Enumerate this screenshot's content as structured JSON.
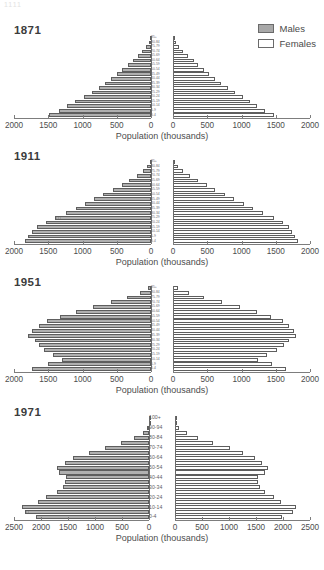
{
  "figure": {
    "top_fragment": "1111",
    "axis_label": "Population (thousands)",
    "legend": {
      "males_label": "Males",
      "females_label": "Females",
      "males_color": "#b0b0b0",
      "females_color": "#ffffff",
      "outline_color": "#5e5e5e"
    }
  },
  "chart_data": [
    {
      "type": "bar",
      "title": "1871",
      "subtype": "population-pyramid",
      "xlabel": "Population (thousands)",
      "ylabel": "",
      "xlim": [
        0,
        2000
      ],
      "ticks": [
        2000,
        1500,
        1000,
        500,
        0
      ],
      "ticks_right": [
        0,
        500,
        1000,
        1500,
        2000
      ],
      "grid": false,
      "legend_position": "top-right",
      "categories": [
        "0-4",
        "5-9",
        "10-14",
        "15-19",
        "20-24",
        "25-29",
        "30-34",
        "35-39",
        "40-44",
        "45-49",
        "50-54",
        "55-59",
        "60-64",
        "65-69",
        "70-74",
        "75-79",
        "80-84",
        "85+"
      ],
      "series": [
        {
          "name": "Males",
          "values": [
            1490,
            1350,
            1230,
            1105,
            985,
            860,
            760,
            665,
            580,
            500,
            425,
            340,
            270,
            195,
            130,
            75,
            36,
            14
          ]
        },
        {
          "name": "Females",
          "values": [
            1470,
            1345,
            1230,
            1125,
            1020,
            905,
            800,
            700,
            610,
            530,
            455,
            370,
            300,
            220,
            152,
            92,
            46,
            20
          ]
        }
      ]
    },
    {
      "type": "bar",
      "title": "1911",
      "subtype": "population-pyramid",
      "xlabel": "Population (thousands)",
      "ylabel": "",
      "xlim": [
        0,
        2000
      ],
      "ticks": [
        2000,
        1500,
        1000,
        500,
        0
      ],
      "ticks_right": [
        0,
        500,
        1000,
        1500,
        2000
      ],
      "grid": false,
      "legend_position": "none",
      "categories": [
        "0-4",
        "5-9",
        "10-14",
        "15-19",
        "20-24",
        "25-29",
        "30-34",
        "35-39",
        "40-44",
        "45-49",
        "50-54",
        "55-59",
        "60-64",
        "65-69",
        "70-74",
        "75-79",
        "80-84",
        "85+"
      ],
      "series": [
        {
          "name": "Males",
          "values": [
            1840,
            1790,
            1735,
            1660,
            1540,
            1395,
            1245,
            1100,
            960,
            830,
            700,
            560,
            430,
            315,
            210,
            120,
            55,
            18
          ]
        },
        {
          "name": "Females",
          "values": [
            1820,
            1780,
            1730,
            1690,
            1600,
            1470,
            1320,
            1175,
            1030,
            890,
            760,
            620,
            490,
            370,
            255,
            152,
            74,
            27
          ]
        }
      ]
    },
    {
      "type": "bar",
      "title": "1951",
      "subtype": "population-pyramid",
      "xlabel": "Population (thousands)",
      "ylabel": "",
      "xlim": [
        0,
        2000
      ],
      "ticks": [
        2000,
        1500,
        1000,
        500,
        0
      ],
      "ticks_right": [
        0,
        500,
        1000,
        1500,
        2000
      ],
      "grid": false,
      "legend_position": "none",
      "categories": [
        "0-4",
        "5-9",
        "10-14",
        "15-19",
        "20-24",
        "25-29",
        "30-34",
        "35-39",
        "40-44",
        "45-49",
        "50-54",
        "55-59",
        "60-64",
        "65-69",
        "70-74",
        "75-79",
        "80-84",
        "85+"
      ],
      "series": [
        {
          "name": "Males",
          "values": [
            1730,
            1510,
            1300,
            1430,
            1560,
            1640,
            1700,
            1790,
            1730,
            1640,
            1520,
            1330,
            1100,
            840,
            580,
            350,
            165,
            50
          ]
        },
        {
          "name": "Females",
          "values": [
            1650,
            1440,
            1245,
            1375,
            1520,
            1615,
            1690,
            1800,
            1760,
            1700,
            1600,
            1430,
            1230,
            975,
            710,
            455,
            235,
            80
          ]
        }
      ]
    },
    {
      "type": "bar",
      "title": "1971",
      "subtype": "population-pyramid",
      "xlabel": "Population (thousands)",
      "ylabel": "",
      "xlim": [
        0,
        2500
      ],
      "ticks": [
        2500,
        2000,
        1500,
        1000,
        500,
        0
      ],
      "ticks_right": [
        0,
        500,
        1000,
        1500,
        2000,
        2500
      ],
      "grid": false,
      "legend_position": "none",
      "categories": [
        "0-4",
        "5-9",
        "10-14",
        "15-19",
        "20-24",
        "25-29",
        "30-34",
        "35-39",
        "40-44",
        "45-49",
        "50-54",
        "55-59",
        "60-64",
        "65-69",
        "70-74",
        "75-79",
        "80-84",
        "85-89",
        "90-94",
        "95-99",
        "100+"
      ],
      "series": [
        {
          "name": "Males",
          "values": [
            2100,
            2300,
            2350,
            2060,
            1900,
            1700,
            1600,
            1560,
            1540,
            1660,
            1700,
            1560,
            1400,
            1120,
            820,
            520,
            280,
            120,
            38,
            9,
            2
          ]
        },
        {
          "name": "Females",
          "values": [
            1990,
            2190,
            2240,
            1960,
            1830,
            1660,
            1570,
            1540,
            1530,
            1660,
            1720,
            1610,
            1490,
            1260,
            1010,
            710,
            430,
            215,
            78,
            20,
            4
          ]
        }
      ]
    }
  ]
}
